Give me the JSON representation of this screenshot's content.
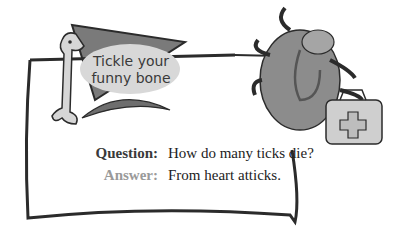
{
  "bubble": {
    "line1": "Tickle your",
    "line2": "funny bone"
  },
  "joke": {
    "question_label": "Question:",
    "question_text": "How do many ticks die?",
    "answer_label": "Answer:",
    "answer_text": "From heart atticks."
  },
  "colors": {
    "frame": "#2b2b2b",
    "pennant": "#7a7a7a",
    "bubble": "#d8d8d8",
    "tick_body": "#8c8c8c",
    "bag": "#cfcfcf",
    "question_label": "#3a3a3a",
    "answer_label": "#9a9a9a"
  }
}
